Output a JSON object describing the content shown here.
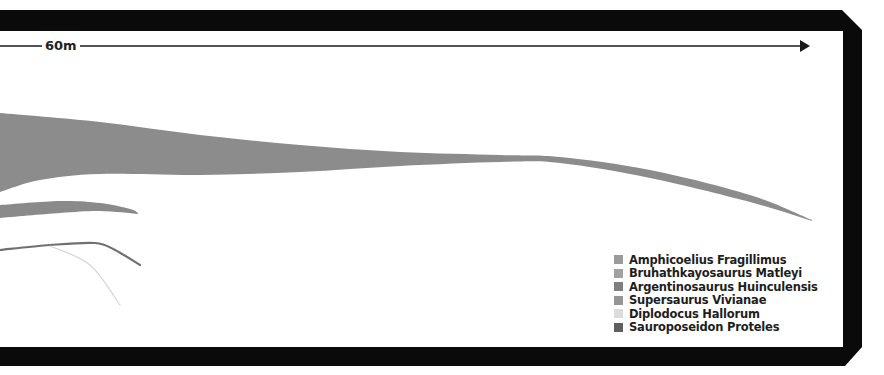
{
  "chart_data": {
    "type": "area",
    "title": "",
    "subtitle": "",
    "scale_bar": {
      "label": "60m",
      "direction": "right",
      "y": 46,
      "x_start": 0,
      "x_end": 810
    },
    "legend": {
      "position": "bottom-right",
      "entries": [
        {
          "name": "Amphicoelius Fragillimus",
          "color": "#9a9a9a"
        },
        {
          "name": "Bruhathkayosaurus Matleyi",
          "color": "#a2a2a2"
        },
        {
          "name": "Argentinosaurus Huinculensis",
          "color": "#7f7f7f"
        },
        {
          "name": "Supersaurus Vivianae",
          "color": "#959595"
        },
        {
          "name": "Diplodocus Hallorum",
          "color": "#dcdcdc"
        },
        {
          "name": "Sauroposeidon Proteles",
          "color": "#5f5f5f"
        }
      ]
    },
    "series": [
      {
        "name": "Amphicoelius Fragillimus",
        "shape": "tail",
        "color": "#8c8c8c",
        "top": [
          [
            0,
            113
          ],
          [
            100,
            122
          ],
          [
            200,
            135
          ],
          [
            300,
            145
          ],
          [
            400,
            152
          ],
          [
            500,
            155
          ],
          [
            560,
            157
          ],
          [
            650,
            170
          ],
          [
            750,
            195
          ],
          [
            812,
            220
          ]
        ],
        "bottom": [
          [
            0,
            192
          ],
          [
            40,
            180
          ],
          [
            100,
            174
          ],
          [
            200,
            175
          ],
          [
            300,
            172
          ],
          [
            400,
            166
          ],
          [
            500,
            162
          ],
          [
            560,
            163
          ],
          [
            650,
            178
          ],
          [
            750,
            202
          ],
          [
            812,
            221
          ]
        ]
      },
      {
        "name": "Supersaurus Vivianae",
        "shape": "tail",
        "color": "#8a8a8a",
        "top": [
          [
            0,
            205
          ],
          [
            60,
            201
          ],
          [
            100,
            203
          ],
          [
            130,
            209
          ],
          [
            138,
            213
          ]
        ],
        "bottom": [
          [
            0,
            218
          ],
          [
            60,
            213
          ],
          [
            100,
            211
          ],
          [
            138,
            214
          ]
        ]
      },
      {
        "name": "Sauroposeidon Proteles",
        "shape": "line",
        "color": "#707070",
        "points": [
          [
            0,
            250
          ],
          [
            50,
            245
          ],
          [
            95,
            243
          ],
          [
            115,
            250
          ],
          [
            140,
            265
          ]
        ]
      },
      {
        "name": "Diplodocus Hallorum",
        "shape": "line",
        "color": "#d6d6d6",
        "points": [
          [
            50,
            246
          ],
          [
            90,
            265
          ],
          [
            120,
            305
          ]
        ]
      }
    ],
    "grid": false,
    "xlabel": "",
    "ylabel": ""
  },
  "frame": {
    "color": "#0a0a0a"
  }
}
